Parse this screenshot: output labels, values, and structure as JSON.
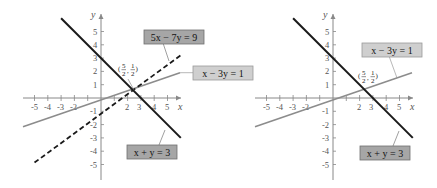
{
  "figure": {
    "panels": [
      {
        "id": "left",
        "axes": {
          "x_label": "x",
          "y_label": "y",
          "x_ticks": [
            "-5",
            "-4",
            "-3",
            "-2",
            "2",
            "3",
            "4",
            "5"
          ],
          "y_ticks": [
            "5",
            "4",
            "3",
            "2",
            "1",
            "-1",
            "-2",
            "-3",
            "-4",
            "-5"
          ]
        },
        "lines": [
          {
            "equation": "5x − 7y = 9",
            "style": "dashed",
            "color": "#1a1a1a"
          },
          {
            "equation": "x − 3y = 1",
            "style": "solid",
            "color": "#8c8c8c"
          },
          {
            "equation": "x + y = 3",
            "style": "solid",
            "color": "#1a1a1a"
          }
        ],
        "intersection": {
          "label": "(5/2, 1/2)",
          "x_num": "5",
          "x_den": "2",
          "y_num": "1",
          "y_den": "2"
        }
      },
      {
        "id": "right",
        "axes": {
          "x_label": "x",
          "y_label": "y",
          "x_ticks": [
            "-5",
            "-4",
            "-3",
            "-2",
            "2",
            "3",
            "4",
            "5"
          ],
          "y_ticks": [
            "5",
            "4",
            "3",
            "2",
            "1",
            "-1",
            "-2",
            "-3",
            "-4",
            "-5"
          ]
        },
        "lines": [
          {
            "equation": "x − 3y = 1",
            "style": "solid",
            "color": "#8c8c8c"
          },
          {
            "equation": "x + y = 3",
            "style": "solid",
            "color": "#1a1a1a"
          }
        ],
        "intersection": {
          "label": "(5/2, 1/2)",
          "x_num": "5",
          "x_den": "2",
          "y_num": "1",
          "y_den": "2"
        }
      }
    ],
    "colors": {
      "label_box_dark": "#a6a6a6",
      "label_box_light": "#cfcfcf",
      "axis": "#888888"
    }
  }
}
